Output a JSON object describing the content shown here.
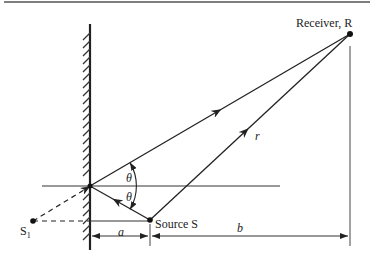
{
  "diagram": {
    "type": "acoustic image-source reflection geometry",
    "labels": {
      "receiver": "Receiver, R",
      "source": "Source S",
      "image_source": "S",
      "image_source_sub": "1",
      "angle_upper": "θ",
      "angle_lower": "θ",
      "distance_r": "r",
      "dim_a": "a",
      "dim_b": "b"
    },
    "colors": {
      "line": "#222222",
      "background": "#ffffff"
    },
    "elements": [
      "reflecting wall (hatched)",
      "direct path S→R labeled r",
      "reflected path S→wall→R",
      "dashed image path S1→wall",
      "horizontal reference line",
      "dimension lines a and b"
    ]
  }
}
